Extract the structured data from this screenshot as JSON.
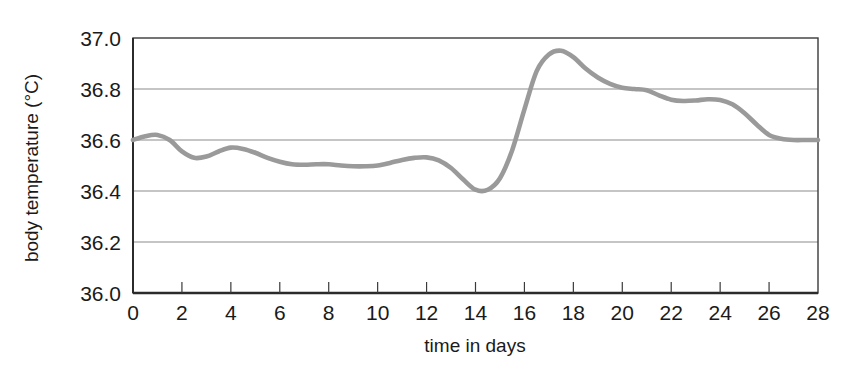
{
  "chart_data": {
    "type": "line",
    "title": "",
    "xlabel": "time in days",
    "ylabel": "body temperature (°C)",
    "xlim": [
      0,
      28
    ],
    "ylim": [
      36.0,
      37.0
    ],
    "grid": true,
    "legend": "none",
    "line_color": "#9a9a9a",
    "axis_color": "#3a3a3a",
    "grid_color": "#8c8c8c",
    "xticks": [
      0,
      2,
      4,
      6,
      8,
      10,
      12,
      14,
      16,
      18,
      20,
      22,
      24,
      26,
      28
    ],
    "xtick_labels": [
      "0",
      "2",
      "4",
      "6",
      "8",
      "10",
      "12",
      "14",
      "16",
      "18",
      "20",
      "22",
      "24",
      "26",
      "28"
    ],
    "yticks": [
      36.0,
      36.2,
      36.4,
      36.6,
      36.8,
      37.0
    ],
    "ytick_labels": [
      "36.0",
      "36.2",
      "36.4",
      "36.6",
      "36.8",
      "37.0"
    ],
    "series": [
      {
        "name": "body temperature",
        "x": [
          0,
          0.5,
          1.0,
          1.5,
          2.0,
          2.5,
          3.0,
          3.5,
          4.0,
          4.5,
          5.0,
          5.5,
          6.0,
          6.5,
          7.0,
          7.5,
          8.0,
          8.5,
          9.0,
          9.5,
          10.0,
          10.5,
          11.0,
          11.5,
          12.0,
          12.5,
          13.0,
          13.5,
          14.0,
          14.5,
          15.0,
          15.5,
          16.0,
          16.5,
          17.0,
          17.5,
          18.0,
          18.5,
          19.0,
          19.5,
          20.0,
          20.5,
          21.0,
          21.5,
          22.0,
          22.5,
          23.0,
          23.5,
          24.0,
          24.5,
          25.0,
          25.5,
          26.0,
          26.5,
          27.0,
          27.5,
          28.0
        ],
        "y": [
          36.6,
          36.615,
          36.62,
          36.6,
          36.555,
          36.53,
          36.535,
          36.555,
          36.57,
          36.565,
          36.55,
          36.53,
          36.515,
          36.505,
          36.503,
          36.505,
          36.505,
          36.5,
          36.497,
          36.497,
          36.5,
          36.51,
          36.522,
          36.53,
          36.532,
          36.52,
          36.49,
          36.445,
          36.405,
          36.405,
          36.45,
          36.56,
          36.72,
          36.87,
          36.935,
          36.95,
          36.925,
          36.88,
          36.845,
          36.82,
          36.805,
          36.8,
          36.795,
          36.775,
          36.758,
          36.753,
          36.755,
          36.76,
          36.757,
          36.74,
          36.705,
          36.66,
          36.62,
          36.605,
          36.6,
          36.6,
          36.6
        ]
      }
    ]
  }
}
